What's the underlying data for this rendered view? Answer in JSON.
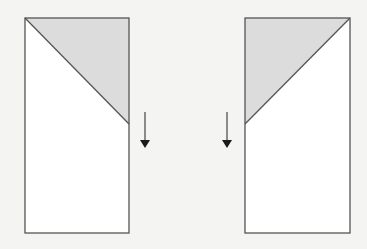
{
  "canvas": {
    "width": 367,
    "height": 249,
    "background": "#f4f4f2"
  },
  "colors": {
    "stroke": "#555555",
    "panel_fill": "#ffffff",
    "shade_fill": "#dcdcdc",
    "arrow": "#1a1a1a"
  },
  "panels": [
    {
      "id": "left",
      "rect": {
        "x": 25,
        "y": 18,
        "w": 104,
        "h": 215
      },
      "shaded_triangle": [
        [
          25,
          18
        ],
        [
          129,
          18
        ],
        [
          129,
          124
        ]
      ],
      "diagonal": [
        [
          25,
          18
        ],
        [
          129,
          124
        ]
      ]
    },
    {
      "id": "right",
      "rect": {
        "x": 245,
        "y": 18,
        "w": 105,
        "h": 215
      },
      "shaded_triangle": [
        [
          245,
          18
        ],
        [
          350,
          18
        ],
        [
          245,
          124
        ]
      ],
      "diagonal": [
        [
          350,
          18
        ],
        [
          245,
          124
        ]
      ]
    }
  ],
  "arrows": [
    {
      "id": "left-arrow",
      "direction": "down",
      "x": 145,
      "y1": 112,
      "y2": 148
    },
    {
      "id": "right-arrow",
      "direction": "down",
      "x": 227,
      "y1": 112,
      "y2": 148
    }
  ]
}
